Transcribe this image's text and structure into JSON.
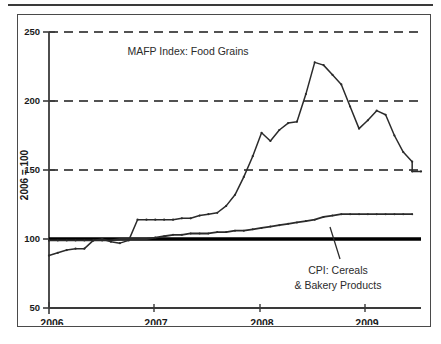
{
  "figure": {
    "axis_title_y": "2006 = 100",
    "series_label_mafp": "MAFP Index: Food Grains",
    "series_label_cpi_line1": "CPI: Cereals",
    "series_label_cpi_line2": "& Bakery Products",
    "colors": {
      "line": "#2b2b2b",
      "gridline": "#1a1a1a",
      "reference_line": "#000000",
      "axis": "#3a3a3a",
      "frame": "#4a4a4a",
      "background": "#ffffff"
    }
  },
  "chart_data": {
    "type": "line",
    "title": "",
    "xlabel": "",
    "ylabel": "2006 = 100",
    "ylim": [
      50,
      250
    ],
    "xlim": [
      2006.0,
      2009.5
    ],
    "yticks": [
      50,
      100,
      150,
      200,
      250
    ],
    "ytick_labels": [
      "50",
      "100",
      "150",
      "200",
      "250"
    ],
    "xticks": [
      2006,
      2007,
      2008,
      2009
    ],
    "xtick_labels": [
      "2006",
      "2007",
      "2008",
      "2009"
    ],
    "grid": "horizontal dashed at 150, 200, 250",
    "reference_line": {
      "value": 100,
      "style": "solid bold",
      "label": ""
    },
    "legend": "none (inline annotations)",
    "annotations": [
      {
        "text": "MAFP Index: Food Grains",
        "x": 2007.05,
        "y": 238
      },
      {
        "text": "CPI: Cereals",
        "x": 2008.95,
        "y": 76
      },
      {
        "text": "& Bakery Products",
        "x": 2008.95,
        "y": 68
      }
    ],
    "series": [
      {
        "name": "MAFP Index: Food Grains",
        "x": [
          2006.0,
          2006.083,
          2006.167,
          2006.25,
          2006.333,
          2006.417,
          2006.5,
          2006.583,
          2006.667,
          2006.75,
          2006.833,
          2006.917,
          2007.0,
          2007.083,
          2007.167,
          2007.25,
          2007.333,
          2007.417,
          2007.5,
          2007.583,
          2007.667,
          2007.75,
          2007.833,
          2007.917,
          2008.0,
          2008.083,
          2008.167,
          2008.25,
          2008.333,
          2008.417,
          2008.5,
          2008.583,
          2008.667,
          2008.75,
          2008.833,
          2008.917,
          2009.0,
          2009.083,
          2009.167,
          2009.25,
          2009.333,
          2009.417
        ],
        "values": [
          88,
          90,
          92,
          93,
          93,
          99,
          100,
          98,
          97,
          99,
          114,
          114,
          114,
          114,
          114,
          115,
          115,
          117,
          118,
          119,
          124,
          132,
          145,
          160,
          177,
          171,
          179,
          184,
          185,
          205,
          228,
          226,
          219,
          212,
          196,
          180,
          186,
          193,
          190,
          175,
          163,
          156
        ]
      },
      {
        "name": "CPI: Cereals & Bakery Products",
        "x": [
          2006.0,
          2006.083,
          2006.167,
          2006.25,
          2006.333,
          2006.417,
          2006.5,
          2006.583,
          2006.667,
          2006.75,
          2006.833,
          2006.917,
          2007.0,
          2007.083,
          2007.167,
          2007.25,
          2007.333,
          2007.417,
          2007.5,
          2007.583,
          2007.667,
          2007.75,
          2007.833,
          2007.917,
          2008.0,
          2008.083,
          2008.167,
          2008.25,
          2008.333,
          2008.417,
          2008.5,
          2008.583,
          2008.667,
          2008.75,
          2008.833,
          2008.917,
          2009.0,
          2009.083,
          2009.167,
          2009.25,
          2009.333,
          2009.417
        ],
        "values": [
          99,
          99,
          99,
          99,
          99,
          99,
          99,
          99,
          100,
          100,
          100,
          100,
          101,
          102,
          103,
          103,
          104,
          104,
          104,
          105,
          105,
          106,
          106,
          107,
          108,
          109,
          110,
          111,
          112,
          113,
          114,
          116,
          117,
          118,
          118,
          118,
          118,
          118,
          118,
          118,
          118,
          118
        ]
      }
    ],
    "series_tail": {
      "mafp_tail_x": [
        2009.417,
        2009.5
      ],
      "mafp_tail_values": [
        149,
        149
      ]
    }
  }
}
